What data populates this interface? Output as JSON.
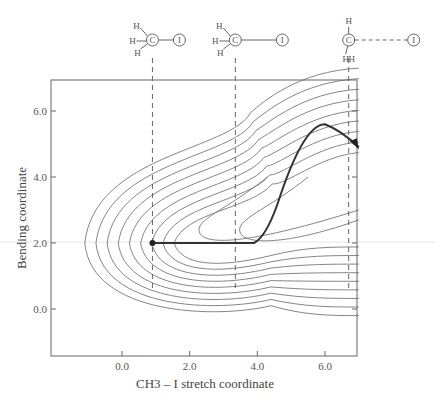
{
  "chart_data": {
    "type": "contour",
    "title": "",
    "xlabel": "CH3 – I stretch coordinate",
    "ylabel": "Bending coordinate",
    "xlim": [
      -2.0,
      7.0
    ],
    "ylim": [
      -1.4,
      7.0
    ],
    "x_ticks": [
      {
        "value": 0.0,
        "label": "0.0"
      },
      {
        "value": 2.0,
        "label": "2.0"
      },
      {
        "value": 4.0,
        "label": "4.0"
      },
      {
        "value": 6.0,
        "label": "6.0"
      }
    ],
    "y_ticks": [
      {
        "value": 0.0,
        "label": "0.0"
      },
      {
        "value": 2.0,
        "label": "2.0"
      },
      {
        "value": 4.0,
        "label": "4.0"
      },
      {
        "value": 6.0,
        "label": "6.0"
      }
    ],
    "grid": false,
    "contour_count": 11,
    "trajectory": {
      "start": [
        0.9,
        2.0
      ],
      "points": [
        [
          0.9,
          2.0
        ],
        [
          2.5,
          2.0
        ],
        [
          3.9,
          2.0
        ],
        [
          4.3,
          2.2
        ],
        [
          4.7,
          3.5
        ],
        [
          5.3,
          5.0
        ],
        [
          6.0,
          5.6
        ],
        [
          6.5,
          5.4
        ],
        [
          7.0,
          4.9
        ]
      ],
      "arrow_at_end": true
    },
    "reference_lines_x": [
      0.9,
      3.35,
      6.7
    ],
    "molecules": [
      {
        "x": 0.9,
        "label": "CH3I bent (start)",
        "atoms": [
          "H",
          "H",
          "H",
          "C",
          "I"
        ],
        "bond": "solid-short"
      },
      {
        "x": 3.35,
        "label": "CH3I stretched",
        "atoms": [
          "H",
          "H",
          "H",
          "C",
          "I"
        ],
        "bond": "solid-long"
      },
      {
        "x": 6.7,
        "label": "CH3 + I dissociated",
        "atoms": [
          "H",
          "H",
          "H",
          "C",
          "I"
        ],
        "bond": "dashed"
      }
    ]
  }
}
